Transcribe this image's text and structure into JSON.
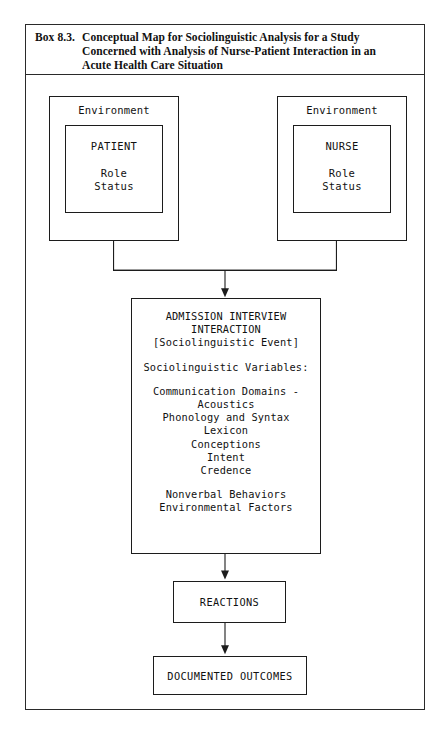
{
  "box": {
    "number": "Box 8.3.",
    "title_lines": [
      "Conceptual Map for Sociolinguistic Analysis for a Study",
      "Concerned with Analysis of Nurse-Patient Interaction in an",
      "Acute Health Care Situation"
    ]
  },
  "diagram": {
    "type": "flowchart",
    "environment_left": {
      "label": "Environment",
      "actor": "PATIENT",
      "attributes": [
        "Role",
        "Status"
      ]
    },
    "environment_right": {
      "label": "Environment",
      "actor": "NURSE",
      "attributes": [
        "Role",
        "Status"
      ]
    },
    "main": {
      "heading_line1": "ADMISSION INTERVIEW",
      "heading_line2": "INTERACTION",
      "event": "[Sociolinguistic Event]",
      "variables_header": "Sociolinguistic Variables:",
      "variables_group1": [
        "Communication Domains -",
        "Acoustics",
        "Phonology and Syntax",
        "Lexicon",
        "Conceptions",
        "Intent",
        "Credence"
      ],
      "variables_group2": [
        "Nonverbal Behaviors",
        "Environmental Factors"
      ]
    },
    "reactions": "REACTIONS",
    "outcomes": "DOCUMENTED OUTCOMES",
    "colors": {
      "line": "#1c1c1c",
      "background": "#ffffff",
      "text": "#111111"
    }
  }
}
